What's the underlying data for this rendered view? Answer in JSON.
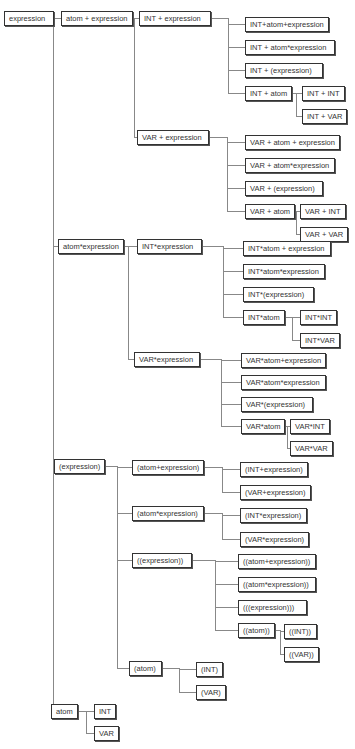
{
  "diagram": {
    "type": "derivation-tree",
    "line_color": "#888888",
    "border_color": "#333333",
    "nodes": [
      {
        "id": "n0",
        "label": "expression",
        "x": 4,
        "y": 11,
        "w": 50
      },
      {
        "id": "n1",
        "label": "atom + expression",
        "x": 61,
        "y": 11,
        "w": 70
      },
      {
        "id": "n2",
        "label": "INT + expression",
        "x": 139,
        "y": 11,
        "w": 72
      },
      {
        "id": "n3",
        "label": "INT+atom+expression",
        "x": 245,
        "y": 17,
        "w": 84
      },
      {
        "id": "n4",
        "label": "INT + atom*expression",
        "x": 245,
        "y": 40,
        "w": 90
      },
      {
        "id": "n5",
        "label": "INT + (expression)",
        "x": 245,
        "y": 63,
        "w": 78
      },
      {
        "id": "n6",
        "label": "INT + atom",
        "x": 245,
        "y": 86,
        "w": 45
      },
      {
        "id": "n7",
        "label": "INT + INT",
        "x": 302,
        "y": 86,
        "w": 40
      },
      {
        "id": "n8",
        "label": "INT + VAR",
        "x": 302,
        "y": 109,
        "w": 40
      },
      {
        "id": "n9",
        "label": "VAR + expression",
        "x": 137,
        "y": 130,
        "w": 72
      },
      {
        "id": "n10",
        "label": "VAR + atom +  expression",
        "x": 245,
        "y": 135,
        "w": 92
      },
      {
        "id": "n11",
        "label": "VAR + atom*expression",
        "x": 245,
        "y": 158,
        "w": 90
      },
      {
        "id": "n12",
        "label": "VAR + (expression)",
        "x": 245,
        "y": 181,
        "w": 78
      },
      {
        "id": "n13",
        "label": "VAR + atom",
        "x": 245,
        "y": 204,
        "w": 46
      },
      {
        "id": "n14",
        "label": "VAR + INT",
        "x": 300,
        "y": 204,
        "w": 42
      },
      {
        "id": "n15",
        "label": "VAR + VAR",
        "x": 300,
        "y": 227,
        "w": 42
      },
      {
        "id": "n16",
        "label": "atom*expression",
        "x": 58,
        "y": 239,
        "w": 64
      },
      {
        "id": "n17",
        "label": "INT*expression",
        "x": 137,
        "y": 239,
        "w": 65
      },
      {
        "id": "n18",
        "label": "INT*atom + expression",
        "x": 243,
        "y": 241,
        "w": 88
      },
      {
        "id": "n19",
        "label": "INT*atom*expression",
        "x": 243,
        "y": 264,
        "w": 82
      },
      {
        "id": "n20",
        "label": "INT*(expression)",
        "x": 243,
        "y": 287,
        "w": 71
      },
      {
        "id": "n21",
        "label": "INT*atom",
        "x": 243,
        "y": 310,
        "w": 40
      },
      {
        "id": "n22",
        "label": "INT*INT",
        "x": 300,
        "y": 310,
        "w": 36
      },
      {
        "id": "n23",
        "label": "INT*VAR",
        "x": 300,
        "y": 333,
        "w": 36
      },
      {
        "id": "n24",
        "label": "VAR*expression",
        "x": 134,
        "y": 352,
        "w": 66
      },
      {
        "id": "n25",
        "label": "VAR*atom+expression",
        "x": 241,
        "y": 353,
        "w": 85
      },
      {
        "id": "n26",
        "label": "VAR*atom*expression",
        "x": 241,
        "y": 375,
        "w": 85
      },
      {
        "id": "n27",
        "label": "VAR*(expression)",
        "x": 241,
        "y": 397,
        "w": 72
      },
      {
        "id": "n28",
        "label": "VAR*atom",
        "x": 241,
        "y": 419,
        "w": 42
      },
      {
        "id": "n29",
        "label": "VAR*INT",
        "x": 290,
        "y": 419,
        "w": 36
      },
      {
        "id": "n30",
        "label": "VAR*VAR",
        "x": 290,
        "y": 441,
        "w": 37
      },
      {
        "id": "n31",
        "label": "(expression)",
        "x": 54,
        "y": 459,
        "w": 50
      },
      {
        "id": "n32",
        "label": "(atom+expression)",
        "x": 132,
        "y": 460,
        "w": 72
      },
      {
        "id": "n33",
        "label": "(INT+expression)",
        "x": 240,
        "y": 462,
        "w": 68
      },
      {
        "id": "n34",
        "label": "(VAR+expression)",
        "x": 240,
        "y": 485,
        "w": 69
      },
      {
        "id": "n35",
        "label": "(atom*expression)",
        "x": 132,
        "y": 506,
        "w": 72
      },
      {
        "id": "n36",
        "label": "(INT*expression)",
        "x": 240,
        "y": 508,
        "w": 67
      },
      {
        "id": "n37",
        "label": "(VAR*expression)",
        "x": 240,
        "y": 532,
        "w": 69
      },
      {
        "id": "n38",
        "label": "((expression))",
        "x": 132,
        "y": 553,
        "w": 60
      },
      {
        "id": "n39",
        "label": "((atom+expression))",
        "x": 238,
        "y": 554,
        "w": 78
      },
      {
        "id": "n40",
        "label": "((atom*expression))",
        "x": 238,
        "y": 577,
        "w": 78
      },
      {
        "id": "n41",
        "label": "(((expression)))",
        "x": 238,
        "y": 600,
        "w": 69
      },
      {
        "id": "n42",
        "label": "((atom))",
        "x": 238,
        "y": 623,
        "w": 37
      },
      {
        "id": "n43",
        "label": "((INT))",
        "x": 284,
        "y": 624,
        "w": 33
      },
      {
        "id": "n44",
        "label": "((VAR))",
        "x": 284,
        "y": 647,
        "w": 34
      },
      {
        "id": "n45",
        "label": "(atom)",
        "x": 129,
        "y": 661,
        "w": 33
      },
      {
        "id": "n46",
        "label": "(INT)",
        "x": 196,
        "y": 662,
        "w": 26
      },
      {
        "id": "n47",
        "label": "(VAR)",
        "x": 196,
        "y": 685,
        "w": 27
      },
      {
        "id": "n48",
        "label": "atom",
        "x": 51,
        "y": 704,
        "w": 26
      },
      {
        "id": "n49",
        "label": "INT",
        "x": 94,
        "y": 704,
        "w": 18
      },
      {
        "id": "n50",
        "label": "VAR",
        "x": 94,
        "y": 726,
        "w": 20
      }
    ],
    "edges": [
      [
        "n0",
        "n1"
      ],
      [
        "n0",
        "n16"
      ],
      [
        "n0",
        "n31"
      ],
      [
        "n0",
        "n48"
      ],
      [
        "n1",
        "n2"
      ],
      [
        "n1",
        "n9"
      ],
      [
        "n2",
        "n3"
      ],
      [
        "n2",
        "n4"
      ],
      [
        "n2",
        "n5"
      ],
      [
        "n2",
        "n6"
      ],
      [
        "n6",
        "n7"
      ],
      [
        "n6",
        "n8"
      ],
      [
        "n9",
        "n10"
      ],
      [
        "n9",
        "n11"
      ],
      [
        "n9",
        "n12"
      ],
      [
        "n9",
        "n13"
      ],
      [
        "n13",
        "n14"
      ],
      [
        "n13",
        "n15"
      ],
      [
        "n16",
        "n17"
      ],
      [
        "n16",
        "n24"
      ],
      [
        "n17",
        "n18"
      ],
      [
        "n17",
        "n19"
      ],
      [
        "n17",
        "n20"
      ],
      [
        "n17",
        "n21"
      ],
      [
        "n21",
        "n22"
      ],
      [
        "n21",
        "n23"
      ],
      [
        "n24",
        "n25"
      ],
      [
        "n24",
        "n26"
      ],
      [
        "n24",
        "n27"
      ],
      [
        "n24",
        "n28"
      ],
      [
        "n28",
        "n29"
      ],
      [
        "n28",
        "n30"
      ],
      [
        "n31",
        "n32"
      ],
      [
        "n31",
        "n35"
      ],
      [
        "n31",
        "n38"
      ],
      [
        "n31",
        "n45"
      ],
      [
        "n32",
        "n33"
      ],
      [
        "n32",
        "n34"
      ],
      [
        "n35",
        "n36"
      ],
      [
        "n35",
        "n37"
      ],
      [
        "n38",
        "n39"
      ],
      [
        "n38",
        "n40"
      ],
      [
        "n38",
        "n41"
      ],
      [
        "n38",
        "n42"
      ],
      [
        "n42",
        "n43"
      ],
      [
        "n42",
        "n44"
      ],
      [
        "n45",
        "n46"
      ],
      [
        "n45",
        "n47"
      ],
      [
        "n48",
        "n49"
      ],
      [
        "n48",
        "n50"
      ]
    ]
  }
}
